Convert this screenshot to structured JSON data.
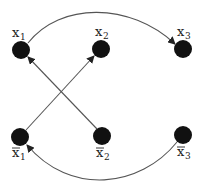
{
  "diagram": {
    "type": "directed-graph",
    "nodes": [
      {
        "id": "x1",
        "base": "x",
        "sub": "1",
        "negated": false,
        "cx": 21,
        "cy": 50
      },
      {
        "id": "x2",
        "base": "x",
        "sub": "2",
        "negated": false,
        "cx": 101,
        "cy": 49
      },
      {
        "id": "x3",
        "base": "x",
        "sub": "3",
        "negated": false,
        "cx": 183,
        "cy": 49
      },
      {
        "id": "nx1",
        "base": "x",
        "sub": "1",
        "negated": true,
        "cx": 20,
        "cy": 137
      },
      {
        "id": "nx2",
        "base": "x",
        "sub": "2",
        "negated": true,
        "cx": 102,
        "cy": 136
      },
      {
        "id": "nx3",
        "base": "x",
        "sub": "3",
        "negated": true,
        "cx": 183,
        "cy": 135
      }
    ],
    "edges": [
      {
        "from": "x1",
        "to": "x3",
        "style": "curved-top"
      },
      {
        "from": "nx1",
        "to": "x2",
        "style": "straight"
      },
      {
        "from": "nx2",
        "to": "x1",
        "style": "straight"
      },
      {
        "from": "nx3",
        "to": "nx1",
        "style": "curved-bottom"
      }
    ],
    "labels": {
      "x1": {
        "base": "x",
        "sub": "1"
      },
      "x2": {
        "base": "x",
        "sub": "2"
      },
      "x3": {
        "base": "x",
        "sub": "3"
      },
      "nx1": {
        "base": "x",
        "sub": "1"
      },
      "nx2": {
        "base": "x",
        "sub": "2"
      },
      "nx3": {
        "base": "x",
        "sub": "3"
      }
    },
    "colors": {
      "node": "#111111",
      "edge": "#555555",
      "text": "#222222"
    }
  }
}
